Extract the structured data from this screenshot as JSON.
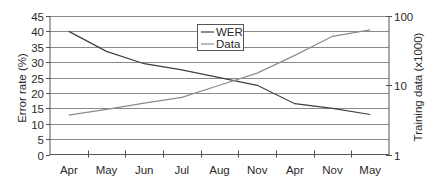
{
  "chart_data": {
    "type": "line",
    "title": "",
    "categories": [
      "Apr",
      "May",
      "Jun",
      "Jul",
      "Aug",
      "Nov",
      "Apr",
      "Nov",
      "May"
    ],
    "xlabel": "",
    "ylabel": "Error rate (%)",
    "y2label": "Training data (x1000)",
    "ylim": [
      0,
      45
    ],
    "yticks": [
      0,
      5,
      10,
      15,
      20,
      25,
      30,
      35,
      40,
      45
    ],
    "y2lim": [
      1,
      100
    ],
    "y2scale": "log",
    "y2ticks": [
      1,
      10,
      100
    ],
    "grid": true,
    "legend_position": "top-center",
    "series": [
      {
        "name": "WER",
        "axis": "left",
        "color": "#404040",
        "values": [
          40,
          33.5,
          29.5,
          27.5,
          25,
          22.5,
          16.5,
          15,
          13
        ]
      },
      {
        "name": "Data",
        "axis": "right",
        "color": "#8c8c8c",
        "values": [
          3.7,
          4.5,
          5.5,
          6.7,
          10,
          15,
          27,
          51,
          63
        ]
      }
    ]
  },
  "labels": {
    "yticks": [
      "0",
      "5",
      "10",
      "15",
      "20",
      "25",
      "30",
      "35",
      "40",
      "45"
    ],
    "y2ticks": [
      "1",
      "10",
      "100"
    ],
    "ylabel": "Error rate (%)",
    "y2label": "Training data (x1000)",
    "legend": [
      "WER",
      "Data"
    ]
  }
}
